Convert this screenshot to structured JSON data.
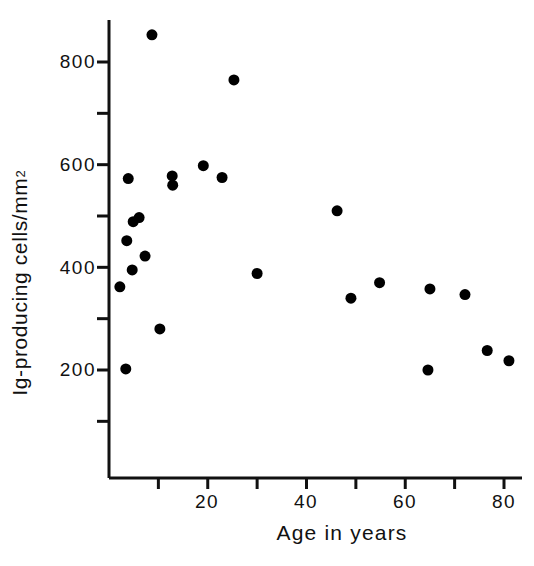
{
  "chart_data": {
    "type": "scatter",
    "title": "",
    "xlabel": "Age in years",
    "ylabel_text": "Ig-producing cells/mm",
    "ylabel_sup": "2",
    "xlim": [
      0,
      84
    ],
    "ylim": [
      0,
      900
    ],
    "grid": false,
    "legend": "none",
    "marker": {
      "shape": "circle",
      "color": "#000000",
      "size_px": 11
    },
    "x_ticks": [
      10,
      20,
      30,
      40,
      50,
      60,
      70,
      80
    ],
    "x_tick_labels": [
      "",
      "20",
      "",
      "40",
      "",
      "60",
      "",
      "80"
    ],
    "y_ticks": [
      100,
      200,
      300,
      400,
      500,
      600,
      700,
      800
    ],
    "y_tick_labels": [
      "",
      "200",
      "",
      "400",
      "",
      "600",
      "",
      "800"
    ],
    "series": [
      {
        "name": "Ig-producing cells",
        "points": [
          {
            "x": 2.2,
            "y": 362
          },
          {
            "x": 3.4,
            "y": 202
          },
          {
            "x": 3.6,
            "y": 452
          },
          {
            "x": 3.9,
            "y": 573
          },
          {
            "x": 4.7,
            "y": 395
          },
          {
            "x": 4.9,
            "y": 489
          },
          {
            "x": 6.1,
            "y": 497
          },
          {
            "x": 7.3,
            "y": 422
          },
          {
            "x": 8.7,
            "y": 853
          },
          {
            "x": 10.3,
            "y": 280
          },
          {
            "x": 12.8,
            "y": 578
          },
          {
            "x": 12.9,
            "y": 560
          },
          {
            "x": 19.1,
            "y": 598
          },
          {
            "x": 22.9,
            "y": 575
          },
          {
            "x": 25.3,
            "y": 765
          },
          {
            "x": 30.0,
            "y": 388
          },
          {
            "x": 46.2,
            "y": 510
          },
          {
            "x": 49.0,
            "y": 340
          },
          {
            "x": 54.8,
            "y": 370
          },
          {
            "x": 64.6,
            "y": 200
          },
          {
            "x": 65.0,
            "y": 358
          },
          {
            "x": 72.1,
            "y": 347
          },
          {
            "x": 76.6,
            "y": 238
          },
          {
            "x": 81.0,
            "y": 218
          }
        ]
      }
    ]
  },
  "axes": {
    "x_title": "Age in years",
    "y_title_main": "Ig-producing cells/mm",
    "y_title_superscript": "2",
    "y_labels": [
      "800",
      "600",
      "400",
      "200"
    ],
    "x_labels": [
      "20",
      "40",
      "60",
      "80"
    ]
  },
  "colors": {
    "axis": "#111111",
    "marker": "#000000",
    "background": "#ffffff"
  }
}
